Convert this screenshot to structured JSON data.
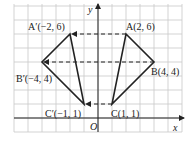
{
  "figure": {
    "axes": {
      "x_label": "x",
      "y_label": "y",
      "origin_label": "O"
    },
    "grid": {
      "x_min": -6,
      "x_max": 6,
      "y_min": -1,
      "y_max": 8,
      "unit_px": 14,
      "origin_px": [
        98,
        118
      ]
    },
    "points": [
      {
        "name": "A",
        "label": "A(2, 6)",
        "x": 2,
        "y": 6
      },
      {
        "name": "B",
        "label": "B(4, 4)",
        "x": 4,
        "y": 4
      },
      {
        "name": "C",
        "label": "C(1, 1)",
        "x": 1,
        "y": 1
      },
      {
        "name": "A'",
        "label": "A′(−2, 6)",
        "x": -2,
        "y": 6
      },
      {
        "name": "B'",
        "label": "B′(−4, 4)",
        "x": -4,
        "y": 4
      },
      {
        "name": "C'",
        "label": "C′(−1, 1)",
        "x": -1,
        "y": 1
      }
    ],
    "triangles": [
      {
        "name": "ABC",
        "vertices": [
          "A",
          "B",
          "C"
        ]
      },
      {
        "name": "A'B'C'",
        "vertices": [
          "A'",
          "B'",
          "C'"
        ]
      }
    ],
    "translation_arrows": [
      {
        "from": "A",
        "to": "A'"
      },
      {
        "from": "B",
        "to": "B'"
      },
      {
        "from": "C",
        "to": "C'"
      }
    ],
    "colors": {
      "grid": "#c8c8c8",
      "line": "#222222"
    }
  }
}
